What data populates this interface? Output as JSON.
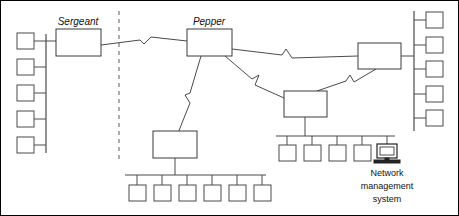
{
  "diagram": {
    "type": "network-topology",
    "background_color": "#ffffff",
    "line_color": "#4a4a4a",
    "divider_color": "#9a9a9a",
    "routers": [
      {
        "id": "sergeant",
        "label": "Sergeant",
        "label_style": "italic",
        "x": 55,
        "y": 28,
        "w": 45,
        "h": 27
      },
      {
        "id": "pepper",
        "label": "Pepper",
        "label_style": "italic",
        "x": 186,
        "y": 28,
        "w": 45,
        "h": 27
      },
      {
        "id": "right-router",
        "label": "",
        "label_style": "none",
        "x": 357,
        "y": 42,
        "w": 43,
        "h": 26
      },
      {
        "id": "center-router",
        "label": "",
        "label_style": "none",
        "x": 283,
        "y": 90,
        "w": 43,
        "h": 26
      },
      {
        "id": "lower-left-router",
        "label": "",
        "label_style": "none",
        "x": 152,
        "y": 130,
        "w": 44,
        "h": 27
      }
    ],
    "buses": [
      {
        "id": "left-vertical-bus",
        "orientation": "vertical",
        "host_count": 5,
        "hosts_side": "left"
      },
      {
        "id": "right-vertical-bus",
        "orientation": "vertical",
        "host_count": 5,
        "hosts_side": "right"
      },
      {
        "id": "bottom-left-bus",
        "orientation": "horizontal",
        "host_count": 6,
        "hosts_side": "below"
      },
      {
        "id": "bottom-center-bus",
        "orientation": "horizontal",
        "host_count": 5,
        "hosts_side": "below"
      }
    ],
    "links": [
      {
        "id": "link-sergeant-pepper",
        "from": "sergeant",
        "to": "pepper",
        "style": "wan-zigzag"
      },
      {
        "id": "link-pepper-right-router",
        "from": "pepper",
        "to": "right-router",
        "style": "wan-zigzag"
      },
      {
        "id": "link-pepper-center-router",
        "from": "pepper",
        "to": "center-router",
        "style": "wan-zigzag"
      },
      {
        "id": "link-pepper-lower-left-router",
        "from": "pepper",
        "to": "lower-left-router",
        "style": "wan-zigzag"
      },
      {
        "id": "link-center-router-right-router",
        "from": "center-router",
        "to": "right-router",
        "style": "wan-zigzag"
      }
    ],
    "divider": {
      "id": "site-divider",
      "style": "dashed-vertical",
      "x": 118,
      "y1": 10,
      "y2": 162
    },
    "nms": {
      "icon_name": "computer-monitor-icon",
      "label_line_1": "Network",
      "label_line_2": "management",
      "label_line_3": "system"
    }
  }
}
